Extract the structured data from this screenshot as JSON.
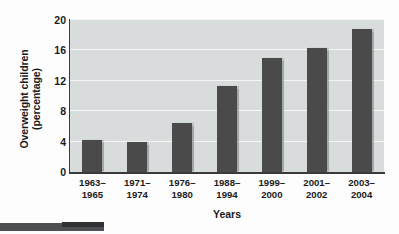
{
  "figure": {
    "name": "overweight-children-bar-chart",
    "background_color": "#fdfdfd",
    "plot_background_color": "#d9dcdc",
    "bar_color": "#4a4a4a",
    "gridline_color": "#f4f5f5",
    "axis_color": "#3a3a3a"
  },
  "chart_data": {
    "type": "bar",
    "title": "",
    "xlabel": "Years",
    "ylabel": "Overweight children (percentage)",
    "ylabel_lines": [
      "Overweight children",
      "(percentage)"
    ],
    "categories": [
      "1963–1965",
      "1971–1974",
      "1976–1980",
      "1988–1994",
      "1999–2000",
      "2001–2002",
      "2003–2004"
    ],
    "category_lines": [
      [
        "1963–",
        "1965"
      ],
      [
        "1971–",
        "1974"
      ],
      [
        "1976–",
        "1980"
      ],
      [
        "1988–",
        "1994"
      ],
      [
        "1999–",
        "2000"
      ],
      [
        "2001–",
        "2002"
      ],
      [
        "2003–",
        "2004"
      ]
    ],
    "values": [
      4.2,
      4.0,
      6.5,
      11.3,
      15.0,
      16.3,
      18.8
    ],
    "ylim": [
      0,
      20
    ],
    "yticks": [
      0,
      4,
      8,
      12,
      16,
      20
    ],
    "ytick_labels": [
      "0",
      "4",
      "8",
      "12",
      "16",
      "20"
    ],
    "grid": true,
    "grid_axis": "y",
    "legend": false,
    "legend_position": "none"
  }
}
